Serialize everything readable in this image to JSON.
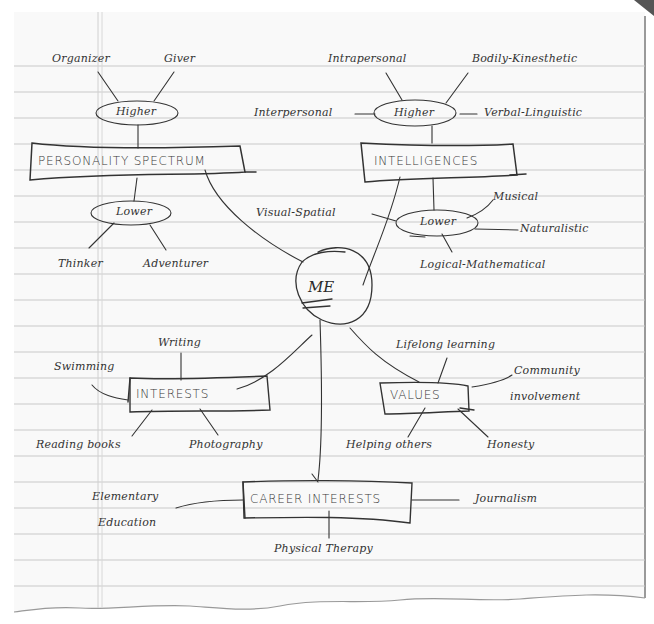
{
  "diagram": {
    "type": "mind-map",
    "center": {
      "label": "ME"
    },
    "branches": [
      {
        "label": "PERSONALITY SPECTRUM",
        "higher": {
          "label": "Higher",
          "items": [
            "Organizer",
            "Giver"
          ]
        },
        "lower": {
          "label": "Lower",
          "items": [
            "Thinker",
            "Adventurer"
          ]
        }
      },
      {
        "label": "INTELLIGENCES",
        "higher": {
          "label": "Higher",
          "items": [
            "Intrapersonal",
            "Bodily-Kinesthetic",
            "Interpersonal",
            "Verbal-Linguistic"
          ]
        },
        "lower": {
          "label": "Lower",
          "items": [
            "Visual-Spatial",
            "Musical",
            "Naturalistic",
            "Logical-Mathematical"
          ]
        }
      },
      {
        "label": "INTERESTS",
        "items": [
          "Writing",
          "Swimming",
          "Reading books",
          "Photography"
        ]
      },
      {
        "label": "VALUES",
        "items": [
          "Lifelong learning",
          "Community involvement",
          "Helping others",
          "Honesty"
        ]
      },
      {
        "label": "CAREER INTERESTS",
        "items": [
          "Elementary Education",
          "Journalism",
          "Physical Therapy"
        ]
      }
    ]
  },
  "labels": {
    "ps": {
      "title": "PERSONALITY SPECTRUM",
      "higher": "Higher",
      "lower": "Lower",
      "organizer": "Organizer",
      "giver": "Giver",
      "thinker": "Thinker",
      "adventurer": "Adventurer"
    },
    "int": {
      "title": "INTELLIGENCES",
      "higher": "Higher",
      "lower": "Lower",
      "intrapersonal": "Intrapersonal",
      "bodily": "Bodily-Kinesthetic",
      "interpersonal": "Interpersonal",
      "verbal": "Verbal-Linguistic",
      "visual": "Visual-Spatial",
      "musical": "Musical",
      "naturalistic": "Naturalistic",
      "logical": "Logical-Mathematical"
    },
    "me": "ME",
    "interests": {
      "title": "INTERESTS",
      "writing": "Writing",
      "swimming": "Swimming",
      "reading": "Reading books",
      "photography": "Photography"
    },
    "values": {
      "title": "VALUES",
      "lifelong": "Lifelong learning",
      "community1": "Community",
      "community2": "involvement",
      "helping": "Helping others",
      "honesty": "Honesty"
    },
    "career": {
      "title": "CAREER INTERESTS",
      "elementary1": "Elementary",
      "elementary2": "Education",
      "journalism": "Journalism",
      "physical": "Physical Therapy"
    }
  },
  "colors": {
    "ink": "#333333",
    "rule": "#c8c8c8",
    "margin": "#d4d4d4",
    "paper": "#fafafa"
  }
}
